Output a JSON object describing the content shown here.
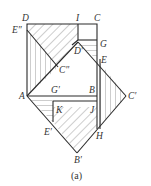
{
  "figure": {
    "caption": "(a)",
    "points": {
      "D": {
        "label": "D",
        "x": 27,
        "y": 24
      },
      "I": {
        "label": "I",
        "x": 78,
        "y": 24
      },
      "C": {
        "label": "C",
        "x": 97,
        "y": 24
      },
      "E2": {
        "label": "E″",
        "x": 27,
        "y": 30
      },
      "G": {
        "label": "G",
        "x": 97,
        "y": 45
      },
      "Dp": {
        "label": "D′",
        "x": 78,
        "y": 45
      },
      "E": {
        "label": "E",
        "x": 97,
        "y": 59
      },
      "C2": {
        "label": "C″",
        "x": 58,
        "y": 67
      },
      "A": {
        "label": "A",
        "x": 27,
        "y": 96
      },
      "Gp": {
        "label": "G′",
        "x": 53,
        "y": 96
      },
      "B": {
        "label": "B",
        "x": 97,
        "y": 96
      },
      "Cp": {
        "label": "C′",
        "x": 126,
        "y": 96
      },
      "K": {
        "label": "K",
        "x": 53,
        "y": 107
      },
      "J": {
        "label": "J",
        "x": 97,
        "y": 107
      },
      "Ep": {
        "label": "E′",
        "x": 53,
        "y": 122
      },
      "H": {
        "label": "H",
        "x": 97,
        "y": 129
      },
      "Bp": {
        "label": "B′",
        "x": 77,
        "y": 153
      }
    },
    "colors": {
      "line": "#2a2a2a",
      "hatch": "#555555",
      "text": "#333333",
      "background": "#ffffff"
    }
  }
}
